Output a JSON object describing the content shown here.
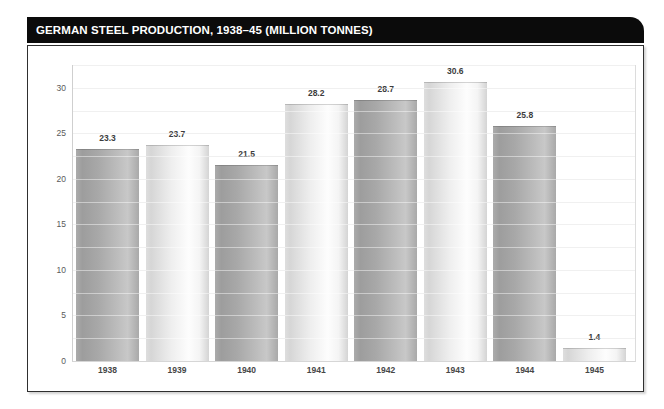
{
  "title_bar": {
    "title": "GERMAN STEEL PRODUCTION, 1938–45 (MILLION TONNES)"
  },
  "chart_data": {
    "type": "bar",
    "title": "GERMAN STEEL PRODUCTION, 1938–45 (MILLION TONNES)",
    "categories": [
      "1938",
      "1939",
      "1940",
      "1941",
      "1942",
      "1943",
      "1944",
      "1945"
    ],
    "values": [
      23.3,
      23.7,
      21.5,
      28.2,
      28.7,
      30.6,
      25.8,
      1.4
    ],
    "value_labels": [
      "23.3",
      "23.7",
      "21.5",
      "28.2",
      "28.7",
      "30.6",
      "25.8",
      "1.4"
    ],
    "xlabel": "",
    "ylabel": "",
    "ylim": [
      0,
      32.5
    ],
    "yticks": [
      0,
      5,
      10,
      15,
      20,
      25,
      30
    ],
    "minor_grid_step": 2.5,
    "grid": true,
    "legend": false,
    "bar_shades": [
      "dark",
      "light",
      "dark",
      "light",
      "dark",
      "light",
      "dark",
      "light"
    ],
    "colors": {
      "title_bg": "#0b0b0b",
      "title_fg": "#ffffff",
      "bar_dark": "#a8a8a8",
      "bar_light": "#ececec",
      "grid": "#e4e4e4",
      "panel_border": "#2f2f2f"
    }
  }
}
